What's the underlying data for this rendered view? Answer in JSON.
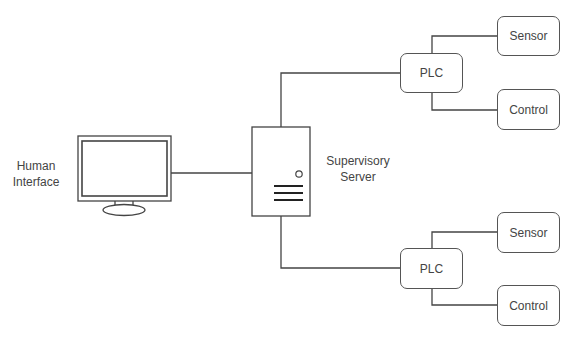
{
  "diagram": {
    "type": "network-topology",
    "nodes": {
      "human_interface": {
        "label_line1": "Human",
        "label_line2": "Interface",
        "icon": "monitor-icon"
      },
      "server": {
        "label_line1": "Supervisory",
        "label_line2": "Server",
        "icon": "server-tower-icon"
      },
      "plc_top": {
        "label": "PLC"
      },
      "sensor_top": {
        "label": "Sensor"
      },
      "control_top": {
        "label": "Control"
      },
      "plc_bottom": {
        "label": "PLC"
      },
      "sensor_bottom": {
        "label": "Sensor"
      },
      "control_bottom": {
        "label": "Control"
      }
    },
    "edges": [
      [
        "human_interface",
        "server"
      ],
      [
        "server",
        "plc_top"
      ],
      [
        "server",
        "plc_bottom"
      ],
      [
        "plc_top",
        "sensor_top"
      ],
      [
        "plc_top",
        "control_top"
      ],
      [
        "plc_bottom",
        "sensor_bottom"
      ],
      [
        "plc_bottom",
        "control_bottom"
      ]
    ],
    "colors": {
      "stroke": "#444444",
      "text": "#444444",
      "background": "#ffffff"
    }
  }
}
